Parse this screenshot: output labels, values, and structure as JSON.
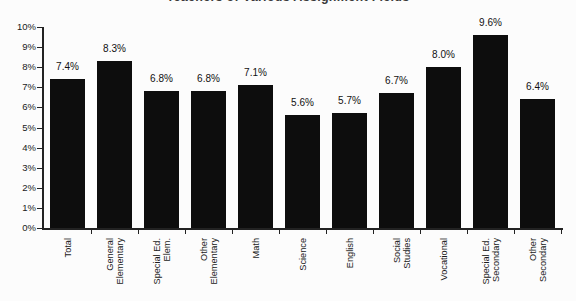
{
  "chart_data": {
    "type": "bar",
    "title_clipped": "Teachers of Various Assignment Fields",
    "categories": [
      "Total",
      "General\nElementary",
      "Special Ed.\nElem.",
      "Other\nElementary",
      "Math",
      "Science",
      "English",
      "Social Studies",
      "Vocational",
      "Special Ed.\nSecondary",
      "Other\nSecondary"
    ],
    "values": [
      7.4,
      8.3,
      6.8,
      6.8,
      7.1,
      5.6,
      5.7,
      6.7,
      8.0,
      9.6,
      6.4
    ],
    "value_labels": [
      "7.4%",
      "8.3%",
      "6.8%",
      "6.8%",
      "7.1%",
      "5.6%",
      "5.7%",
      "6.7%",
      "8.0%",
      "9.6%",
      "6.4%"
    ],
    "y_ticks": [
      "0%",
      "1%",
      "2%",
      "3%",
      "4%",
      "5%",
      "6%",
      "7%",
      "8%",
      "9%",
      "10%"
    ],
    "ylim": [
      0,
      10
    ],
    "xlabel": "",
    "ylabel": "",
    "grid": "off",
    "legend": "none",
    "x_label_rotation": 90,
    "bar_color": "#0d0d0d",
    "axis_color": "#222222",
    "background_color": "#fcfcfc",
    "text_color": "#1a1a1a"
  }
}
